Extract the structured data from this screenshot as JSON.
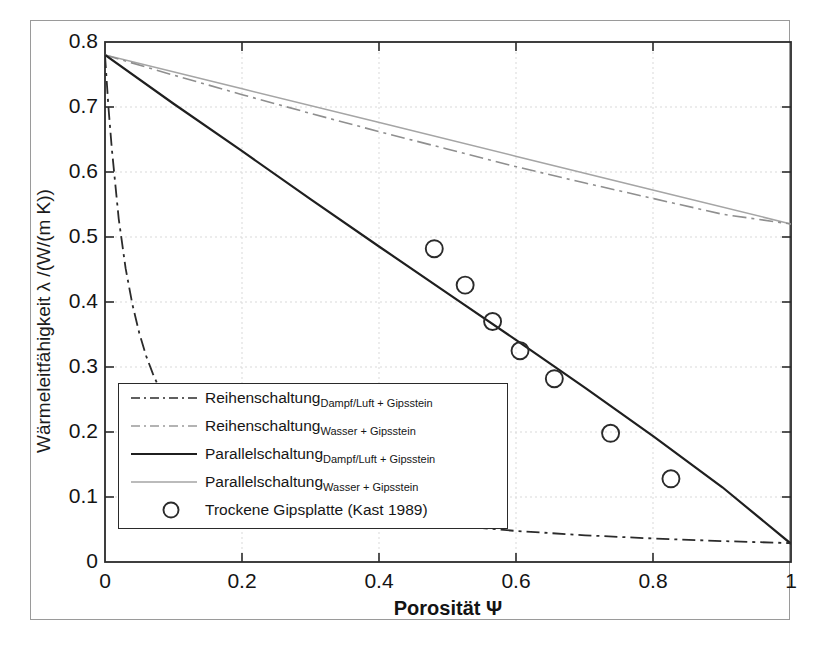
{
  "figure": {
    "x_axis": {
      "label": "Porosität Ψ",
      "ticks": [
        "0",
        "0.2",
        "0.4",
        "0.6",
        "0.8",
        "1"
      ]
    },
    "y_axis": {
      "label": "Wärmeleitfähigkeit λ /(W/(m K))",
      "ticks": [
        "0.8",
        "0.7",
        "0.6",
        "0.5",
        "0.4",
        "0.3",
        "0.2",
        "0.1",
        "0"
      ]
    }
  },
  "legend": {
    "items": [
      {
        "name": "Reihenschaltung",
        "sub": "Dampf/Luft + Gipsstein",
        "style": "dashdot",
        "color": "#2b2b2b"
      },
      {
        "name": "Reihenschaltung",
        "sub": "Wasser + Gipsstein",
        "style": "dashdot",
        "color": "#9a9a9a"
      },
      {
        "name": "Parallelschaltung",
        "sub": "Dampf/Luft + Gipsstein",
        "style": "solid",
        "color": "#1f1f1f"
      },
      {
        "name": "Parallelschaltung",
        "sub": "Wasser + Gipsstein",
        "style": "solid",
        "color": "#a5a5a5"
      },
      {
        "name": "Trockene Gipsplatte (Kast 1989)",
        "sub": "",
        "style": "circle",
        "color": "#2b2b2b"
      }
    ]
  },
  "chart_data": {
    "type": "line",
    "title": "",
    "xlabel": "Porosität Ψ",
    "ylabel": "Wärmeleitfähigkeit λ /(W/(m K))",
    "xlim": [
      0,
      1
    ],
    "ylim": [
      0,
      0.8
    ],
    "xticks": [
      0,
      0.2,
      0.4,
      0.6,
      0.8,
      1
    ],
    "yticks": [
      0,
      0.1,
      0.2,
      0.3,
      0.4,
      0.5,
      0.6,
      0.7,
      0.8
    ],
    "grid": true,
    "legend_position": "lower-left-inside",
    "series": [
      {
        "name": "Reihenschaltung Dampf/Luft + Gipsstein",
        "style": "dashdot",
        "color": "#2b2b2b",
        "x": [
          0,
          0.005,
          0.01,
          0.02,
          0.03,
          0.04,
          0.05,
          0.06,
          0.07,
          0.08,
          0.1,
          0.15,
          0.2,
          0.3,
          0.4,
          0.5,
          0.6,
          0.7,
          0.8,
          0.9,
          1.0
        ],
        "y": [
          0.78,
          0.7,
          0.635,
          0.528,
          0.452,
          0.396,
          0.352,
          0.317,
          0.289,
          0.265,
          0.227,
          0.166,
          0.131,
          0.0915,
          0.07,
          0.0567,
          0.0477,
          0.0411,
          0.0361,
          0.0322,
          0.029
        ]
      },
      {
        "name": "Reihenschaltung Wasser + Gipsstein",
        "style": "dashdot",
        "color": "#9a9a9a",
        "x": [
          0,
          0.1,
          0.2,
          0.3,
          0.4,
          0.5,
          0.6,
          0.7,
          0.8,
          0.9,
          1.0
        ],
        "y": [
          0.78,
          0.749,
          0.719,
          0.69,
          0.662,
          0.635,
          0.608,
          0.583,
          0.559,
          0.535,
          0.52
        ]
      },
      {
        "name": "Parallelschaltung Dampf/Luft + Gipsstein",
        "style": "solid",
        "color": "#1f1f1f",
        "x": [
          0,
          0.1,
          0.2,
          0.3,
          0.4,
          0.5,
          0.6,
          0.7,
          0.8,
          0.9,
          1.0
        ],
        "y": [
          0.78,
          0.705,
          0.632,
          0.558,
          0.485,
          0.413,
          0.341,
          0.268,
          0.193,
          0.115,
          0.028
        ]
      },
      {
        "name": "Parallelschaltung Wasser + Gipsstein",
        "style": "solid",
        "color": "#a5a5a5",
        "x": [
          0,
          0.2,
          0.4,
          0.6,
          0.8,
          1.0
        ],
        "y": [
          0.78,
          0.728,
          0.676,
          0.624,
          0.572,
          0.52
        ]
      },
      {
        "name": "Trockene Gipsplatte (Kast 1989)",
        "style": "scatter-circle",
        "color": "#2b2b2b",
        "x": [
          0.48,
          0.525,
          0.565,
          0.605,
          0.655,
          0.737,
          0.825
        ],
        "y": [
          0.482,
          0.426,
          0.37,
          0.325,
          0.282,
          0.198,
          0.128
        ]
      }
    ]
  }
}
